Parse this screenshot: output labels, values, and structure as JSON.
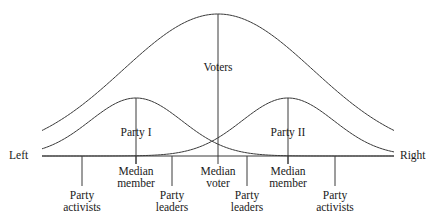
{
  "figure": {
    "type": "line-diagram",
    "background_color": "#ffffff",
    "line_color": "#3a3a3a",
    "text_color": "#1a1a1a"
  },
  "axis": {
    "left_label": "Left",
    "right_label": "Right",
    "baseline_y": 156,
    "x_start": 42,
    "x_end": 394
  },
  "curves": [
    {
      "name": "voters-distribution",
      "label": "Voters",
      "peak_x": 218,
      "peak_y": 14,
      "spread": 95
    },
    {
      "name": "party-one-distribution",
      "label": "Party I",
      "peak_x": 136,
      "peak_y": 98,
      "spread": 46
    },
    {
      "name": "party-two-distribution",
      "label": "Party II",
      "peak_x": 288,
      "peak_y": 98,
      "spread": 46
    }
  ],
  "curve_labels": [
    {
      "name": "voters-label",
      "text": "Voters",
      "x": 218,
      "y": 62
    },
    {
      "name": "party-one-label",
      "text": "Party I",
      "x": 136,
      "y": 127
    },
    {
      "name": "party-two-label",
      "text": "Party II",
      "x": 288,
      "y": 127
    }
  ],
  "ticks": [
    {
      "name": "tick-party-activists-left",
      "x": 82,
      "top": 156,
      "bottom": 186
    },
    {
      "name": "tick-median-member-left",
      "x": 136,
      "top": 156,
      "bottom": 164
    },
    {
      "name": "tick-party-leaders-left",
      "x": 172,
      "top": 156,
      "bottom": 186
    },
    {
      "name": "tick-median-voter",
      "x": 218,
      "top": 156,
      "bottom": 164
    },
    {
      "name": "tick-party-leaders-right",
      "x": 247,
      "top": 156,
      "bottom": 186
    },
    {
      "name": "tick-median-member-right",
      "x": 288,
      "top": 156,
      "bottom": 164
    },
    {
      "name": "tick-party-activists-right",
      "x": 335,
      "top": 156,
      "bottom": 186
    }
  ],
  "axis_labels": [
    {
      "name": "label-median-member-left",
      "line1": "Median",
      "line2": "member",
      "x": 136,
      "y": 165
    },
    {
      "name": "label-median-voter",
      "line1": "Median",
      "line2": "voter",
      "x": 218,
      "y": 165
    },
    {
      "name": "label-median-member-right",
      "line1": "Median",
      "line2": "member",
      "x": 288,
      "y": 165
    },
    {
      "name": "label-party-activists-left",
      "line1": "Party",
      "line2": "activists",
      "x": 82,
      "y": 189
    },
    {
      "name": "label-party-leaders-left",
      "line1": "Party",
      "line2": "leaders",
      "x": 172,
      "y": 189
    },
    {
      "name": "label-party-leaders-right",
      "line1": "Party",
      "line2": "leaders",
      "x": 247,
      "y": 189
    },
    {
      "name": "label-party-activists-right",
      "line1": "Party",
      "line2": "activists",
      "x": 335,
      "y": 189
    }
  ],
  "stems": [
    {
      "name": "stem-voters",
      "x": 218,
      "top": 14,
      "bottom": 156
    },
    {
      "name": "stem-party-one",
      "x": 136,
      "top": 98,
      "bottom": 164
    },
    {
      "name": "stem-party-two",
      "x": 288,
      "top": 98,
      "bottom": 164
    }
  ]
}
